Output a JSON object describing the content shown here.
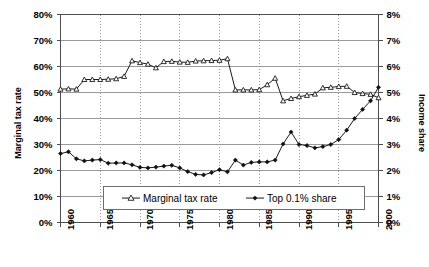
{
  "chart_data": {
    "type": "line",
    "title": "",
    "xlabel": "",
    "ylabel": "Marginal tax rate",
    "y2label": "Income share",
    "xlim": [
      1960,
      2000
    ],
    "ylim": [
      0,
      80
    ],
    "y2lim": [
      0,
      8
    ],
    "grid": true,
    "legend_position": "inside-bottom-center",
    "x": [
      1960,
      1961,
      1962,
      1963,
      1964,
      1965,
      1966,
      1967,
      1968,
      1969,
      1970,
      1971,
      1972,
      1973,
      1974,
      1975,
      1976,
      1977,
      1978,
      1979,
      1980,
      1981,
      1982,
      1983,
      1984,
      1985,
      1986,
      1987,
      1988,
      1989,
      1990,
      1991,
      1992,
      1993,
      1994,
      1995,
      1996,
      1997,
      1998,
      1999,
      2000
    ],
    "xticks": [
      1960,
      1965,
      1970,
      1975,
      1980,
      1985,
      1990,
      1995,
      2000
    ],
    "xticklabels": [
      "1960",
      "1965",
      "1970",
      "1975",
      "1980",
      "1985",
      "1990",
      "1995",
      "2000"
    ],
    "yticks": [
      0,
      10,
      20,
      30,
      40,
      50,
      60,
      70,
      80
    ],
    "yticklabels": [
      "0%",
      "10%",
      "20%",
      "30%",
      "40%",
      "50%",
      "60%",
      "70%",
      "80%"
    ],
    "y2ticks": [
      0,
      1,
      2,
      3,
      4,
      5,
      6,
      7,
      8
    ],
    "y2ticklabels": [
      "0%",
      "1%",
      "2%",
      "3%",
      "4%",
      "5%",
      "6%",
      "7%",
      "8%"
    ],
    "series": [
      {
        "name": "Marginal tax rate",
        "axis": "left",
        "marker": "open-triangle",
        "unit": "%",
        "values": [
          51.3,
          51.4,
          51.3,
          55.0,
          55.0,
          55.0,
          55.1,
          55.3,
          56.2,
          62.2,
          61.5,
          60.9,
          59.5,
          61.9,
          62.0,
          61.7,
          61.6,
          62.1,
          62.2,
          62.3,
          62.4,
          63.0,
          51.0,
          51.0,
          51.0,
          51.1,
          53.0,
          55.5,
          46.8,
          47.7,
          48.4,
          48.9,
          49.4,
          51.8,
          52.0,
          52.3,
          52.4,
          50.0,
          49.6,
          49.3,
          48.0
        ]
      },
      {
        "name": "Top 0.1% share",
        "axis": "right",
        "marker": "filled-diamond",
        "unit": "%",
        "values": [
          2.65,
          2.72,
          2.45,
          2.37,
          2.4,
          2.42,
          2.28,
          2.29,
          2.29,
          2.22,
          2.12,
          2.1,
          2.13,
          2.17,
          2.2,
          2.1,
          1.96,
          1.85,
          1.83,
          1.92,
          2.03,
          1.95,
          2.4,
          2.21,
          2.31,
          2.33,
          2.33,
          2.4,
          3.02,
          3.48,
          3.0,
          2.96,
          2.87,
          2.92,
          3.0,
          3.19,
          3.55,
          4.0,
          4.35,
          4.68,
          5.2
        ]
      }
    ]
  },
  "legend": {
    "items": [
      {
        "label": "Marginal tax rate",
        "marker": "open-triangle"
      },
      {
        "label": "Top 0.1% share",
        "marker": "filled-diamond"
      }
    ]
  },
  "axes": {
    "left_title": "Marginal tax rate",
    "right_title": "Income share"
  }
}
